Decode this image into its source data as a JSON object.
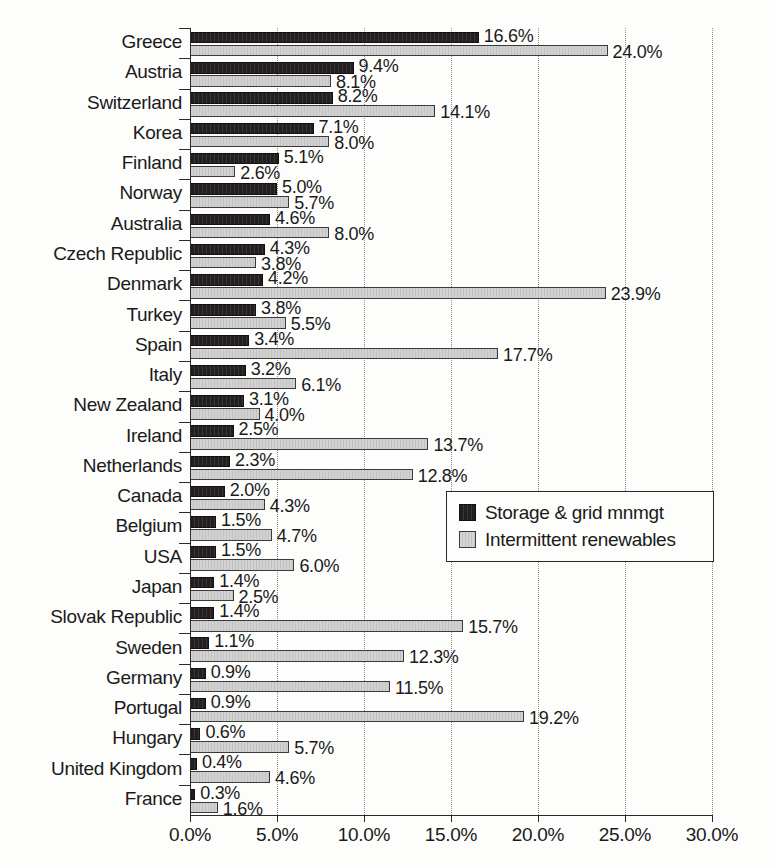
{
  "chart_data": {
    "type": "bar",
    "orientation": "horizontal",
    "title": "",
    "subtitle": "",
    "xlabel": "",
    "ylabel": "",
    "xlim": [
      0,
      30
    ],
    "xtick_labels": [
      "0.0%",
      "5.0%",
      "10.0%",
      "15.0%",
      "20.0%",
      "25.0%",
      "30.0%"
    ],
    "xtick_values": [
      0,
      5,
      10,
      15,
      20,
      25,
      30
    ],
    "grid": true,
    "grid_style": "dotted-vertical",
    "legend_position": "middle-right",
    "value_suffix": "%",
    "categories": [
      "Greece",
      "Austria",
      "Switzerland",
      "Korea",
      "Finland",
      "Norway",
      "Australia",
      "Czech Republic",
      "Denmark",
      "Turkey",
      "Spain",
      "Italy",
      "New Zealand",
      "Ireland",
      "Netherlands",
      "Canada",
      "Belgium",
      "USA",
      "Japan",
      "Slovak Republic",
      "Sweden",
      "Germany",
      "Portugal",
      "Hungary",
      "United Kingdom",
      "France"
    ],
    "series": [
      {
        "name": "Storage & grid mnmgt",
        "color": "#231f20",
        "values": [
          16.6,
          9.4,
          8.2,
          7.1,
          5.1,
          5.0,
          4.6,
          4.3,
          4.2,
          3.8,
          3.4,
          3.2,
          3.1,
          2.5,
          2.3,
          2.0,
          1.5,
          1.5,
          1.4,
          1.4,
          1.1,
          0.9,
          0.9,
          0.6,
          0.4,
          0.3
        ],
        "labels": [
          "16.6%",
          "9.4%",
          "8.2%",
          "7.1%",
          "5.1%",
          "5.0%",
          "4.6%",
          "4.3%",
          "4.2%",
          "3.8%",
          "3.4%",
          "3.2%",
          "3.1%",
          "2.5%",
          "2.3%",
          "2.0%",
          "1.5%",
          "1.5%",
          "1.4%",
          "1.4%",
          "1.1%",
          "0.9%",
          "0.9%",
          "0.6%",
          "0.4%",
          "0.3%"
        ]
      },
      {
        "name": "Intermittent renewables",
        "color": "#cfcfcf",
        "values": [
          24.0,
          8.1,
          14.1,
          8.0,
          2.6,
          5.7,
          8.0,
          3.8,
          23.9,
          5.5,
          17.7,
          6.1,
          4.0,
          13.7,
          12.8,
          4.3,
          4.7,
          6.0,
          2.5,
          15.7,
          12.3,
          11.5,
          19.2,
          5.7,
          4.6,
          1.6
        ],
        "labels": [
          "24.0%",
          "8.1%",
          "14.1%",
          "8.0%",
          "2.6%",
          "5.7%",
          "8.0%",
          "3.8%",
          "23.9%",
          "5.5%",
          "17.7%",
          "6.1%",
          "4.0%",
          "13.7%",
          "12.8%",
          "4.3%",
          "4.7%",
          "6.0%",
          "2.5%",
          "15.7%",
          "12.3%",
          "11.5%",
          "19.2%",
          "5.7%",
          "4.6%",
          "1.6%"
        ]
      }
    ]
  },
  "legend": {
    "items": [
      {
        "label": "Storage & grid mnmgt",
        "swatch": "dark"
      },
      {
        "label": "Intermittent renewables",
        "swatch": "light"
      }
    ]
  }
}
